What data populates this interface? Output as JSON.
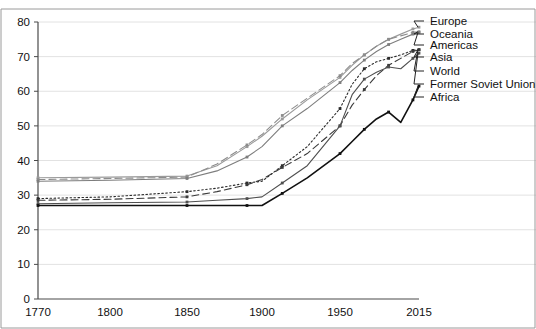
{
  "chart_data": {
    "type": "line",
    "title": "",
    "subtitle": "",
    "xlabel": "",
    "ylabel": "",
    "xlim": [
      1770,
      2015
    ],
    "ylim": [
      0,
      80
    ],
    "grid": true,
    "legend_position": "right-inline-labels",
    "x_ticks": [
      "1770",
      "1800",
      "1850",
      "1900",
      "1950",
      "2015"
    ],
    "x_tick_values": [
      1770,
      1800,
      1850,
      1900,
      1950,
      2015
    ],
    "y_ticks": [
      "0",
      "10",
      "20",
      "30",
      "40",
      "50",
      "60",
      "70",
      "80"
    ],
    "y_tick_values": [
      0,
      10,
      20,
      30,
      40,
      50,
      60,
      70,
      80
    ],
    "x": [
      1770,
      1800,
      1850,
      1870,
      1890,
      1900,
      1913,
      1929,
      1950,
      1960,
      1970,
      1980,
      1990,
      2000,
      2010,
      2015
    ],
    "series": [
      {
        "name": "Europe",
        "color": "#9a9a9a",
        "style": "solid",
        "values": [
          35.0,
          35.2,
          35.5,
          38.5,
          44.0,
          47.0,
          52.0,
          57.5,
          64.0,
          67.5,
          70.5,
          73.0,
          75.0,
          76.5,
          78.0,
          78.5
        ]
      },
      {
        "name": "Oceania",
        "color": "#8c8c8c",
        "style": "dashed",
        "values": [
          34.5,
          34.8,
          35.2,
          39.0,
          44.5,
          47.5,
          53.0,
          58.0,
          64.5,
          68.0,
          70.5,
          73.0,
          75.0,
          76.0,
          77.0,
          77.2
        ]
      },
      {
        "name": "Americas",
        "color": "#7d7d7d",
        "style": "solid",
        "values": [
          34.0,
          34.3,
          34.8,
          37.0,
          41.0,
          44.0,
          50.0,
          55.0,
          62.5,
          66.0,
          69.0,
          71.5,
          73.5,
          75.0,
          76.5,
          77.0
        ]
      },
      {
        "name": "Asia",
        "color": "#2b2b2b",
        "style": "dotted",
        "values": [
          29.0,
          29.5,
          31.0,
          32.0,
          33.5,
          34.0,
          38.5,
          44.0,
          55.0,
          62.0,
          66.5,
          68.5,
          69.5,
          70.5,
          71.8,
          72.0
        ]
      },
      {
        "name": "World",
        "color": "#3a3a3a",
        "style": "dashed",
        "values": [
          28.5,
          28.8,
          29.5,
          31.0,
          33.0,
          34.5,
          38.0,
          42.0,
          50.0,
          56.0,
          60.5,
          64.5,
          67.5,
          69.5,
          71.5,
          72.0
        ]
      },
      {
        "name": "Former Soviet Union",
        "color": "#4f4f4f",
        "style": "solid",
        "values": [
          27.5,
          27.8,
          28.0,
          28.5,
          29.0,
          29.5,
          33.5,
          38.5,
          50.0,
          59.0,
          63.5,
          65.5,
          67.0,
          66.5,
          69.5,
          71.0
        ]
      },
      {
        "name": "Africa",
        "color": "#111111",
        "style": "solid",
        "values": [
          27.0,
          27.0,
          27.0,
          27.0,
          27.0,
          27.0,
          30.5,
          35.0,
          42.0,
          45.5,
          49.0,
          52.0,
          54.0,
          51.0,
          57.5,
          61.5
        ]
      }
    ],
    "legend_entries": [
      {
        "label": "Europe",
        "anchor_y": 21
      },
      {
        "label": "Oceania",
        "anchor_y": 34
      },
      {
        "label": "Americas",
        "anchor_y": 45
      },
      {
        "label": "Asia",
        "anchor_y": 57
      },
      {
        "label": "World",
        "anchor_y": 71
      },
      {
        "label": "Former Soviet Union",
        "anchor_y": 84
      },
      {
        "label": "Africa",
        "anchor_y": 97
      }
    ]
  }
}
